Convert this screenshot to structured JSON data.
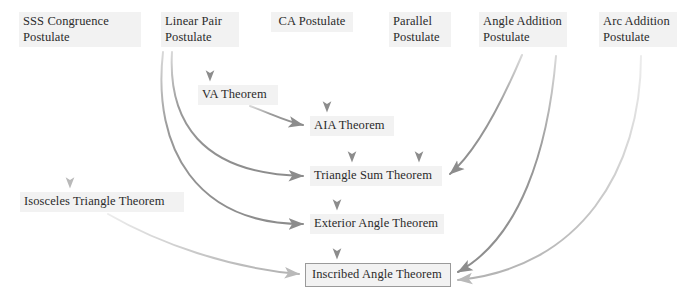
{
  "diagram": {
    "background": "#ffffff",
    "node_fill": "#f2f2f2",
    "text_color": "#2b2b2b",
    "edge_color": "#8c8c8c",
    "nodes": [
      {
        "id": "sss",
        "label": "SSS Congruence\nPostulate",
        "x": 19,
        "y": 12,
        "w": 122,
        "h": 36,
        "boxed": false
      },
      {
        "id": "linear_pair",
        "label": "Linear Pair\nPostulate",
        "x": 161,
        "y": 12,
        "w": 78,
        "h": 36,
        "boxed": false
      },
      {
        "id": "ca",
        "label": "CA Postulate",
        "x": 271,
        "y": 12,
        "w": 82,
        "h": 19,
        "boxed": false
      },
      {
        "id": "parallel",
        "label": "Parallel\nPostulate",
        "x": 389,
        "y": 12,
        "w": 62,
        "h": 36,
        "boxed": false
      },
      {
        "id": "angle_addition",
        "label": "Angle Addition\nPostulate",
        "x": 479,
        "y": 12,
        "w": 88,
        "h": 36,
        "boxed": false
      },
      {
        "id": "arc_addition",
        "label": "Arc Addition\nPostulate",
        "x": 599,
        "y": 12,
        "w": 78,
        "h": 36,
        "boxed": false
      },
      {
        "id": "va",
        "label": "VA Theorem",
        "x": 198,
        "y": 85,
        "w": 80,
        "h": 19,
        "boxed": false
      },
      {
        "id": "aia",
        "label": "AIA Theorem",
        "x": 310,
        "y": 116,
        "w": 84,
        "h": 19,
        "boxed": false
      },
      {
        "id": "isosceles",
        "label": "Isosceles Triangle Theorem",
        "x": 20,
        "y": 192,
        "w": 164,
        "h": 19,
        "boxed": false
      },
      {
        "id": "triangle_sum",
        "label": "Triangle Sum Theorem",
        "x": 310,
        "y": 166,
        "w": 132,
        "h": 19,
        "boxed": false
      },
      {
        "id": "exterior_angle",
        "label": "Exterior Angle Theorem",
        "x": 310,
        "y": 214,
        "w": 134,
        "h": 19,
        "boxed": false
      },
      {
        "id": "inscribed_angle",
        "label": "Inscribed Angle Theorem",
        "x": 305,
        "y": 263,
        "w": 146,
        "h": 23,
        "boxed": true
      }
    ],
    "edges": [
      {
        "id": "sss-to-isosceles",
        "from": "sss",
        "to": "isosceles",
        "kind": "straight",
        "shade": "light",
        "path": "M70,50 L70,188"
      },
      {
        "id": "linear-pair-to-va",
        "from": "linear_pair",
        "to": "va",
        "kind": "straight",
        "shade": "mid",
        "path": "M210,50 L210,81"
      },
      {
        "id": "ca-to-aia",
        "from": "ca",
        "to": "aia",
        "kind": "straight",
        "shade": "mid",
        "path": "M327,34 L327,112"
      },
      {
        "id": "va-to-aia",
        "from": "va",
        "to": "aia",
        "kind": "curve",
        "shade": "mid",
        "path": "M250,106 C272,114 285,121 303,125"
      },
      {
        "id": "linear-pair-to-triangle-sum",
        "from": "linear_pair",
        "to": "triangle_sum",
        "kind": "curve",
        "shade": "mid",
        "path": "M172,52 C168,120 200,174 303,176"
      },
      {
        "id": "linear-pair-to-exterior-angle",
        "from": "linear_pair",
        "to": "exterior_angle",
        "kind": "curve",
        "shade": "mid",
        "path": "M163,52 C152,150 198,224 303,224"
      },
      {
        "id": "aia-to-triangle-sum",
        "from": "aia",
        "to": "triangle_sum",
        "kind": "straight",
        "shade": "mid",
        "path": "M352,138 L352,162"
      },
      {
        "id": "parallel-to-triangle-sum",
        "from": "parallel",
        "to": "triangle_sum",
        "kind": "straight",
        "shade": "mid",
        "path": "M419,51 L419,162"
      },
      {
        "id": "angle-addition-to-triangle-sum",
        "from": "angle_addition",
        "to": "triangle_sum",
        "kind": "curve",
        "shade": "mid",
        "path": "M522,55 C505,95 478,150 450,174"
      },
      {
        "id": "triangle-sum-to-exterior-angle",
        "from": "triangle_sum",
        "to": "exterior_angle",
        "kind": "straight",
        "shade": "mid",
        "path": "M337,188 L337,210"
      },
      {
        "id": "exterior-angle-to-inscribed-angle",
        "from": "exterior_angle",
        "to": "inscribed_angle",
        "kind": "straight",
        "shade": "mid",
        "path": "M337,236 L337,259"
      },
      {
        "id": "isosceles-to-inscribed-angle",
        "from": "isosceles",
        "to": "inscribed_angle",
        "kind": "curve",
        "shade": "light",
        "path": "M108,214 C160,244 230,268 299,274"
      },
      {
        "id": "angle-addition-to-inscribed-angle",
        "from": "angle_addition",
        "to": "inscribed_angle",
        "kind": "curve",
        "shade": "mid",
        "path": "M556,56 C548,150 520,238 458,272"
      },
      {
        "id": "arc-addition-to-inscribed-angle",
        "from": "arc_addition",
        "to": "inscribed_angle",
        "kind": "curve",
        "shade": "light",
        "path": "M641,56 C641,170 580,268 458,280"
      }
    ]
  }
}
